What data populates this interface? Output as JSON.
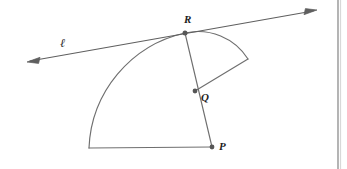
{
  "figure": {
    "type": "geometry-diagram",
    "width": 347,
    "height": 169,
    "background_color": "#ffffff",
    "stroke_color": "#6b6b6b",
    "point_color": "#5a5a5a",
    "label_color": "#1d1d1d"
  },
  "labels": {
    "point_r": "R",
    "point_q": "Q",
    "point_p": "P",
    "line_l": "ℓ"
  },
  "points": [
    {
      "name": "R",
      "label": "R",
      "x": 185,
      "y": 33,
      "label_x": 184,
      "label_y": 14
    },
    {
      "name": "Q",
      "label": "Q",
      "x": 195,
      "y": 91,
      "label_x": 201,
      "label_y": 92
    },
    {
      "name": "P",
      "label": "P",
      "x": 212,
      "y": 147,
      "label_x": 219,
      "label_y": 141
    }
  ],
  "line_l": {
    "label": "ℓ",
    "label_x": 60,
    "label_y": 37,
    "start_x": 28,
    "start_y": 62,
    "end_x": 316,
    "end_y": 11,
    "arrow_start": true,
    "arrow_end": true
  },
  "sectors": [
    {
      "name": "large-sector",
      "center": "P",
      "center_x": 212,
      "center_y": 147,
      "radius": 123,
      "arc_from_x": 185,
      "arc_from_y": 33,
      "arc_to_x": 89,
      "arc_to_y": 148
    },
    {
      "name": "small-sector",
      "center": "Q",
      "center_x": 195,
      "center_y": 91,
      "radius": 59,
      "arc_from_x": 185,
      "arc_from_y": 33,
      "arc_to_x": 248,
      "arc_to_y": 59
    }
  ],
  "page_edge": {
    "name": "page-binding-edge",
    "x": 338,
    "color": "#9a9a9a"
  }
}
